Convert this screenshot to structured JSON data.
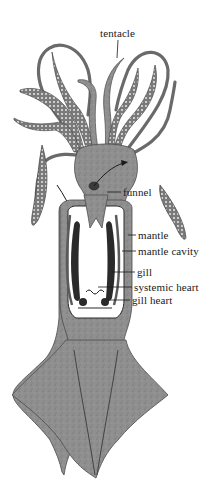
{
  "figure": {
    "colors": {
      "background": "#ffffff",
      "body": "#8f8f8f",
      "body_dark": "#5a5a5a",
      "outline": "#3a3a3a",
      "cavity": "#ffffff",
      "gill": "#2a2a2a",
      "sucker": "#e8e8e8",
      "label_text": "#1a1a1a"
    },
    "labels": [
      {
        "id": "tentacle",
        "text": "tentacle",
        "x": 100,
        "y": 27
      },
      {
        "id": "funnel",
        "text": "funnel",
        "x": 123,
        "y": 186
      },
      {
        "id": "mantle",
        "text": "mantle",
        "x": 138,
        "y": 229
      },
      {
        "id": "mantle_cavity",
        "text": "mantle cavity",
        "x": 138,
        "y": 245
      },
      {
        "id": "gill",
        "text": "gill",
        "x": 137,
        "y": 266
      },
      {
        "id": "systemic_heart",
        "text": "systemic heart",
        "x": 134,
        "y": 281
      },
      {
        "id": "gill_heart",
        "text": "gill heart",
        "x": 132,
        "y": 294
      }
    ]
  }
}
